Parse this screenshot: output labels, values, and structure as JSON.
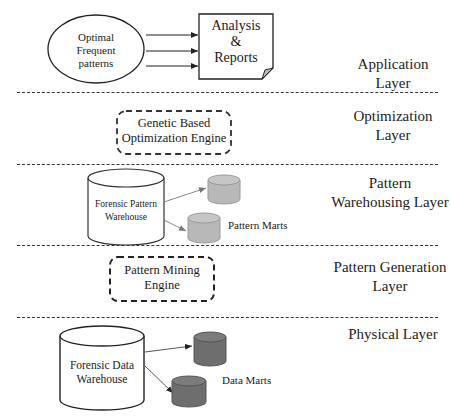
{
  "diagram": {
    "type": "layered-architecture",
    "layers": [
      {
        "name": "Application Layer",
        "label_line1": "Application",
        "label_line2": "Layer"
      },
      {
        "name": "Optimization Layer",
        "label_line1": "Optimization",
        "label_line2": "Layer"
      },
      {
        "name": "Pattern Warehousing Layer",
        "label_line1": "Pattern",
        "label_line2": "Warehousing Layer"
      },
      {
        "name": "Pattern Generation Layer",
        "label_line1": "Pattern Generation",
        "label_line2": "Layer"
      },
      {
        "name": "Physical Layer",
        "label_line1": "Physical Layer",
        "label_line2": ""
      }
    ],
    "application": {
      "ellipse": {
        "line1": "Optimal",
        "line2": "Frequent",
        "line3": "patterns"
      },
      "document": {
        "line1": "Analysis",
        "line2": "&",
        "line3": "Reports"
      }
    },
    "optimization": {
      "engine": {
        "line1": "Genetic Based",
        "line2": "Optimization Engine"
      }
    },
    "pattern_warehousing": {
      "warehouse": {
        "line1": "Forensic Pattern",
        "line2": "Warehouse"
      },
      "marts_label": "Pattern Marts"
    },
    "pattern_generation": {
      "engine": {
        "line1": "Pattern Mining",
        "line2": "Engine"
      }
    },
    "physical": {
      "warehouse": {
        "line1": "Forensic Data",
        "line2": "Warehouse"
      },
      "marts_label": "Data Marts"
    },
    "colors": {
      "line": "#333333",
      "pattern_mart_fill": "#b8b8b8",
      "data_mart_fill": "#6e6e6e",
      "background": "#ffffff"
    }
  }
}
